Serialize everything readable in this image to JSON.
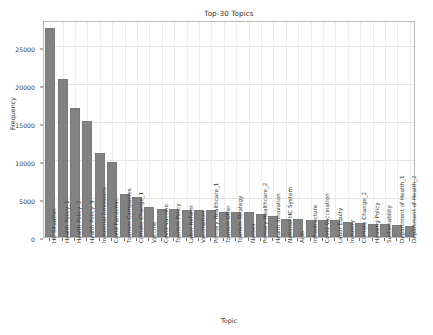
{
  "chart_data": {
    "type": "bar",
    "title": "Top-30 Topics",
    "xlabel": "Topic",
    "ylabel": "Frequency",
    "ylim": [
      0,
      28500
    ],
    "yticks": [
      0,
      5000,
      10000,
      15000,
      20000,
      25000
    ],
    "ytick_labels": [
      "0",
      "5000",
      "10000",
      "15000",
      "20000",
      "25000"
    ],
    "grid": true,
    "legend": null,
    "bar_color": "#828282",
    "categories": [
      "HC Situation",
      "Health Policy_1",
      "Health Policy_2",
      "Health Policy_3",
      "Industrial Emissions",
      "Covid Pandemic",
      "Tourism Companies",
      "Climate Change_1",
      "Vaccine",
      "Covid Vaccine",
      "Tourism Policy",
      "Labor Reform",
      "Vaccination",
      "Primary Healthcare_1",
      "Tourism Offer",
      "Tourism Strategy",
      "Nurses",
      "Primary Healthcare_2",
      "Health Innovation",
      "National HC System",
      "Aids",
      "Infrastructure",
      "Covid Vaccination",
      "Labor Equity",
      "Industry",
      "Climate Change_2",
      "Housing Policy",
      "Sustainability",
      "Department of Health_1",
      "Department of Health_2"
    ],
    "values": [
      27450,
      20700,
      16950,
      15200,
      11000,
      9800,
      5600,
      5300,
      3900,
      3700,
      3700,
      3600,
      3600,
      3500,
      3350,
      3250,
      3220,
      3080,
      2750,
      2400,
      2380,
      2300,
      2300,
      2250,
      2000,
      1880,
      1720,
      1700,
      1570,
      1500
    ]
  }
}
